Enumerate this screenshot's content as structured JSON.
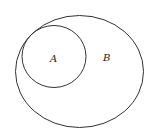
{
  "diagram": {
    "type": "venn",
    "sets": [
      {
        "name": "A",
        "label": "A",
        "relation": "subset of B"
      },
      {
        "name": "B",
        "label": "B"
      }
    ],
    "colors": {
      "stroke": "#333333",
      "background": "#ffffff"
    }
  }
}
